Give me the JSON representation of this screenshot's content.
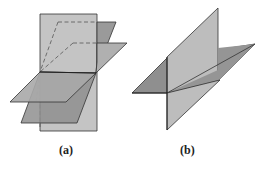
{
  "figure": {
    "panels": [
      {
        "id": "a",
        "caption": "(a)",
        "description": "Three planes intersecting along a common line (a vertical plane and two tilted planes through a shared edge)"
      },
      {
        "id": "b",
        "caption": "(b)",
        "description": "Two perpendicular planes intersecting along a line"
      }
    ],
    "colors": {
      "light_plane": "#c4c4c4",
      "mid_plane": "#a8a8a8",
      "dark_plane": "#8f8f8f",
      "edge": "#333333",
      "hidden_edge": "#555555"
    }
  }
}
